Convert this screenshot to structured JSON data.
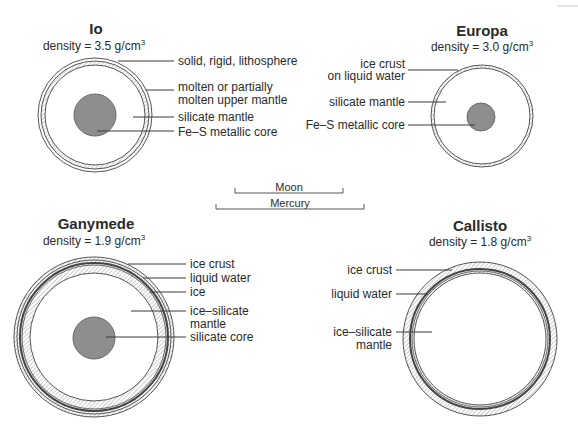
{
  "moons": [
    {
      "name": "Io",
      "density": "density = 3.5 g/cm",
      "density_sup": "3",
      "labels": [
        "solid, rigid, lithosphere",
        "molten or partially",
        "molten upper mantle",
        "silicate mantle",
        "Fe–S metallic core"
      ]
    },
    {
      "name": "Europa",
      "density": "density = 3.0 g/cm",
      "density_sup": "3",
      "labels": [
        "ice crust",
        "on liquid water",
        "silicate mantle",
        "Fe–S metallic core"
      ]
    },
    {
      "name": "Ganymede",
      "density": "density = 1.9 g/cm",
      "density_sup": "3",
      "labels": [
        "ice crust",
        "liquid water",
        "ice",
        "ice–silicate",
        "mantle",
        "silicate core"
      ]
    },
    {
      "name": "Callisto",
      "density": "density = 1.8 g/cm",
      "density_sup": "3",
      "labels": [
        "ice crust",
        "liquid water",
        "ice–silicate",
        "mantle"
      ]
    }
  ],
  "scale_bars": [
    {
      "label": "Moon"
    },
    {
      "label": "Mercury"
    }
  ],
  "colors": {
    "core": "#8e8e8e",
    "hatch": "#9a9a9a",
    "line": "#3a3a3a",
    "text": "#2a2a2a"
  }
}
